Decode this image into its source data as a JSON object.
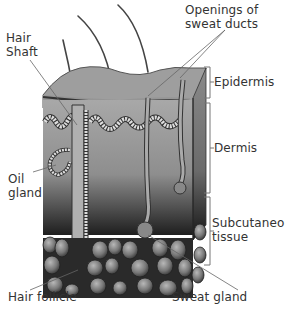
{
  "labels": {
    "hair_shaft": [
      "Hair",
      "Shaft"
    ],
    "openings": [
      "Openings of",
      "sweat ducts"
    ],
    "epidermis": "Epidermis",
    "dermis": "Dermis",
    "oil_gland": [
      "Oil",
      "gland"
    ],
    "subcutaneous": [
      "Subcutaneous",
      "tissue"
    ],
    "hair_follicle": "Hair follicle",
    "sweat_gland": "Sweat gland"
  },
  "layers": [
    {
      "name": "Epidermis",
      "color": "#9a9a9a"
    },
    {
      "name": "Dermis",
      "color": "#8c8c8c"
    },
    {
      "name": "Subcutaneous tissue",
      "color": "#5a5a5a"
    }
  ]
}
